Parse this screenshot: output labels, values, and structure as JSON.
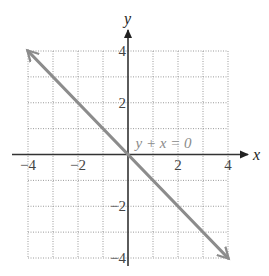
{
  "chart_data": {
    "type": "line",
    "title": "",
    "xlabel": "x",
    "ylabel": "y",
    "xlim": [
      -4,
      4
    ],
    "ylim": [
      -4,
      4
    ],
    "grid": true,
    "grid_step": 1,
    "x_ticks": [
      -4,
      -2,
      2,
      4
    ],
    "y_ticks": [
      4,
      2,
      -2,
      -4
    ],
    "x_tick_labels": [
      "−4",
      "−2",
      "2",
      "4"
    ],
    "y_tick_labels": [
      "4",
      "2",
      "−2",
      "−4"
    ],
    "series": [
      {
        "name": "y + x = 0",
        "equation": "y = -x",
        "x": [
          -4,
          4
        ],
        "y": [
          4,
          -4
        ],
        "arrows": "both",
        "color": "#8c8c8c"
      }
    ],
    "annotations": [
      {
        "text": "y + x = 0",
        "x": 0.3,
        "y": 0.25
      }
    ]
  }
}
